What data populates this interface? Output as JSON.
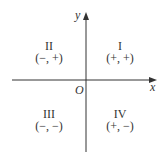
{
  "diagram": {
    "axes": {
      "x_label": "x",
      "y_label": "y",
      "origin_label": "O"
    },
    "quadrants": [
      {
        "id": "I",
        "numeral": "I",
        "signs": "(+, +)"
      },
      {
        "id": "II",
        "numeral": "II",
        "signs": "(−, +)"
      },
      {
        "id": "III",
        "numeral": "III",
        "signs": "(−, −)"
      },
      {
        "id": "IV",
        "numeral": "IV",
        "signs": "(+, −)"
      }
    ],
    "colors": {
      "line": "#333333",
      "text": "#333333"
    }
  }
}
